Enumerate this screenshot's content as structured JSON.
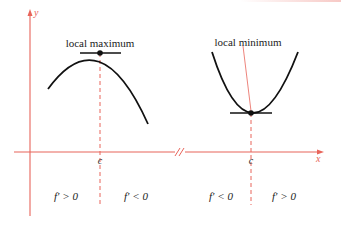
{
  "colors": {
    "axis": "#e8645a",
    "curve": "#111111",
    "text": "#222222"
  },
  "axes": {
    "x_label": "x",
    "y_label": "y",
    "break_mark": "//"
  },
  "left_panel": {
    "title": "local maximum",
    "critical_label": "c",
    "left_region": "f′ > 0",
    "right_region": "f′ < 0"
  },
  "right_panel": {
    "title": "local minimum",
    "critical_label": "c",
    "left_region": "f′ < 0",
    "right_region": "f′ > 0"
  }
}
